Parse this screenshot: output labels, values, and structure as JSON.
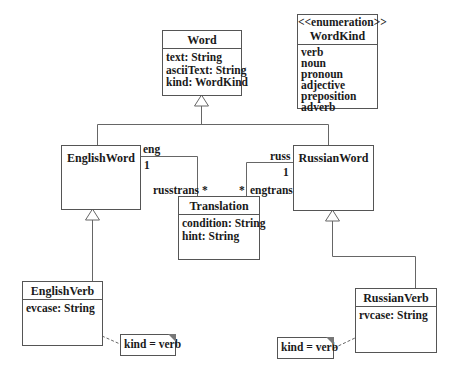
{
  "diagram": {
    "type": "uml-class-diagram",
    "classes": {
      "word": {
        "name": "Word",
        "attributes": [
          "text: String",
          "asciiText: String",
          "kind: WordKind"
        ]
      },
      "word_kind": {
        "stereotype": "<<enumeration>>",
        "name": "WordKind",
        "literals": [
          "verb",
          "noun",
          "pronoun",
          "adjective",
          "preposition",
          "adverb"
        ]
      },
      "english_word": {
        "name": "EnglishWord"
      },
      "russian_word": {
        "name": "RussianWord"
      },
      "translation": {
        "name": "Translation",
        "attributes": [
          "condition: String",
          "hint: String"
        ]
      },
      "english_verb": {
        "name": "EnglishVerb",
        "attributes": [
          "evcase: String"
        ]
      },
      "russian_verb": {
        "name": "RussianVerb",
        "attributes": [
          "rvcase: String"
        ]
      }
    },
    "associations": {
      "english_translation": {
        "role_near_english": "eng",
        "mult_near_english": "1",
        "role_near_translation": "russtrans",
        "mult_near_translation": "*"
      },
      "russian_translation": {
        "role_near_russian": "russ",
        "mult_near_russian": "1",
        "role_near_translation": "engtrans",
        "mult_near_translation": "*"
      }
    },
    "generalizations": [
      {
        "child": "EnglishWord",
        "parent": "Word"
      },
      {
        "child": "RussianWord",
        "parent": "Word"
      },
      {
        "child": "EnglishVerb",
        "parent": "EnglishWord"
      },
      {
        "child": "RussianVerb",
        "parent": "RussianWord"
      }
    ],
    "notes": {
      "english_verb_note": "kind = verb",
      "russian_verb_note": "kind = verb"
    }
  }
}
